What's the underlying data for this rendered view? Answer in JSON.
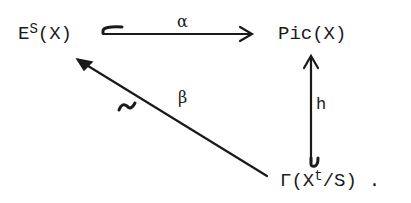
{
  "diagram": {
    "type": "commutative-diagram",
    "nodes": {
      "es": {
        "base": "E",
        "sup": "S",
        "rest": "(X)"
      },
      "pic": {
        "label": "Pic(X)"
      },
      "gamma": {
        "pre": "Γ(X",
        "sup": "t",
        "post": "/S)",
        "trailing": "."
      }
    },
    "arrows": {
      "alpha": {
        "label": "α",
        "from": "E^S(X)",
        "to": "Pic(X)",
        "style": "hooked injection"
      },
      "beta": {
        "label": "β",
        "from": "Γ(X^t/S)",
        "to": "E^S(X)",
        "style": "isomorphism",
        "mark": "~"
      },
      "h": {
        "label": "h",
        "from": "Γ(X^t/S)",
        "to": "Pic(X)",
        "style": "hooked injection"
      }
    }
  }
}
